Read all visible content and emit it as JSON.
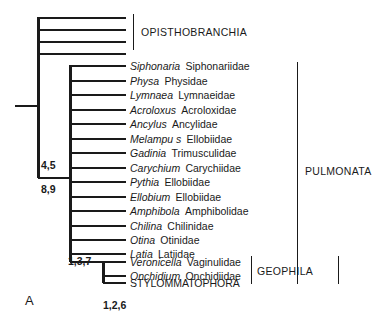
{
  "panel": {
    "label": "A"
  },
  "opisthobranchia": {
    "label": "OPISTHOBRANCHIA",
    "unlabeled_tip_count": 4
  },
  "taxa": [
    {
      "genus": "Siphonaria",
      "family": "Siphonariidae"
    },
    {
      "genus": "Physa",
      "family": "Physidae"
    },
    {
      "genus": "Lymnaea",
      "family": "Lymnaeidae"
    },
    {
      "genus": "Acroloxus",
      "family": "Acroloxidae"
    },
    {
      "genus": "Ancylus",
      "family": "Ancylidae"
    },
    {
      "genus": "Melampu s",
      "family": "Ellobiidae"
    },
    {
      "genus": "Gadinia",
      "family": "Trimusculidae"
    },
    {
      "genus": "Carychium",
      "family": "Carychiidae"
    },
    {
      "genus": "Pythia",
      "family": "Ellobiidae"
    },
    {
      "genus": "Ellobium",
      "family": "Ellobiidae"
    },
    {
      "genus": "Amphibola",
      "family": "Amphibolidae"
    },
    {
      "genus": "Chilina",
      "family": "Chilinidae"
    },
    {
      "genus": "Otina",
      "family": "Otinidae"
    },
    {
      "genus": "Latia",
      "family": "Latiidae"
    },
    {
      "genus": "Veronicella",
      "family": "Vaginulidae"
    },
    {
      "genus": "Onchidium",
      "family": "Onchidiidae"
    },
    {
      "genus": "STYLOMMATOPHORA",
      "family": ""
    }
  ],
  "clade_brackets": [
    {
      "name": "PULMONATA"
    },
    {
      "name": "GEOPHILA"
    }
  ],
  "node_labels": [
    {
      "id": "node-4-5",
      "text": "4,5"
    },
    {
      "id": "node-8-9",
      "text": "8,9"
    },
    {
      "id": "node-1-3-7",
      "text": "1,3,7"
    },
    {
      "id": "node-1-2-6",
      "text": "1,2,6"
    }
  ],
  "colors": {
    "line": "#1a1a1a",
    "text": "#1a1a1a",
    "background": "#ffffff"
  }
}
